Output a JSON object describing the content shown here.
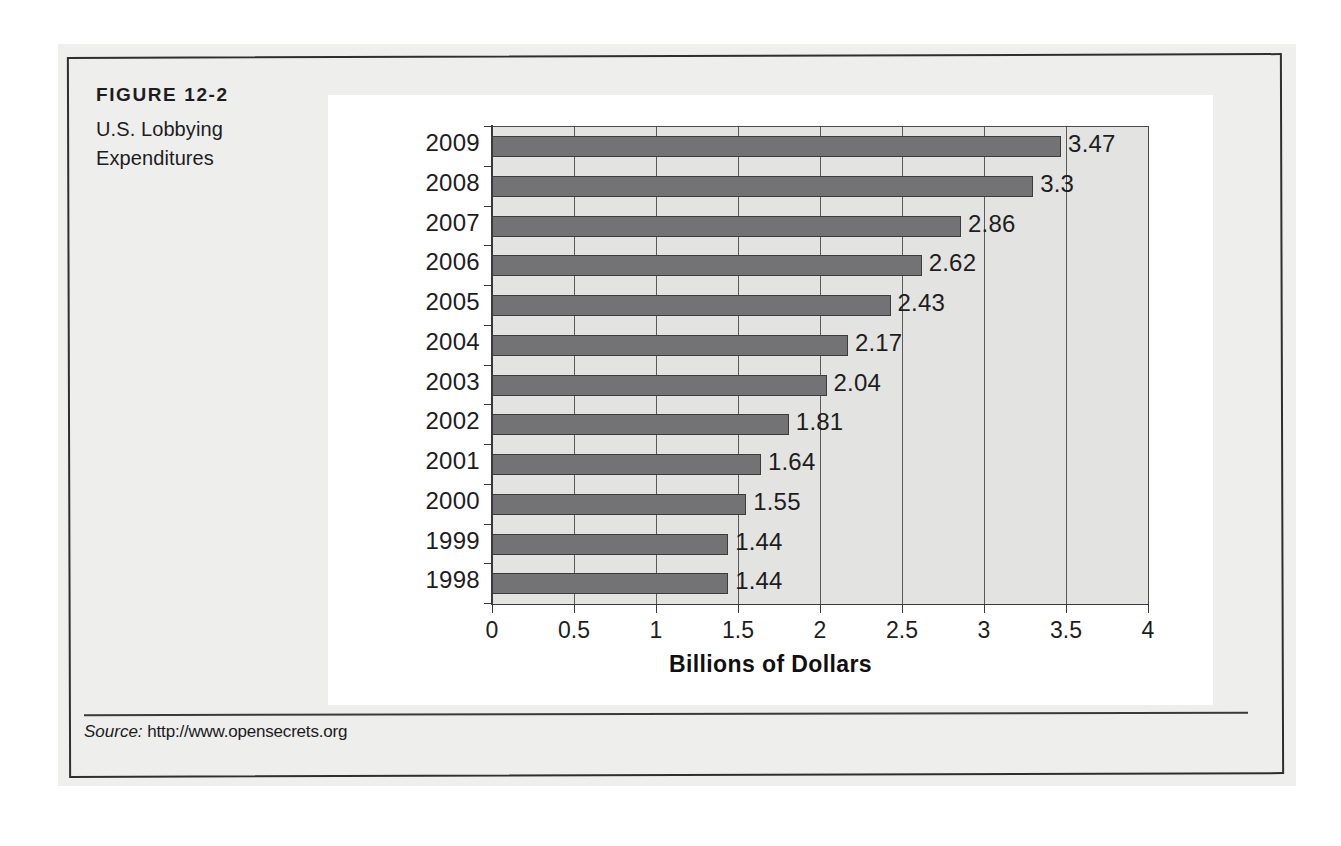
{
  "figure": {
    "number": "FIGURE 12-2",
    "title_line1": "U.S. Lobbying",
    "title_line2": "Expenditures"
  },
  "source": {
    "label": "Source:",
    "url": "http://www.opensecrets.org"
  },
  "colors": {
    "bar_fill": "#737375",
    "bar_stroke": "#3c3c3e",
    "plot_background": "#e3e3e1",
    "panel_background": "#ffffff",
    "paper_background": "#efefee",
    "frame_border": "#2f2f31",
    "text": "#1d1d1f"
  },
  "chart_data": {
    "type": "bar",
    "orientation": "horizontal",
    "title": "U.S. Lobbying Expenditures",
    "xlabel": "Billions of Dollars",
    "ylabel": "",
    "xlim": [
      0,
      4
    ],
    "xticks": [
      "0",
      "0.5",
      "1",
      "1.5",
      "2",
      "2.5",
      "3",
      "3.5",
      "4"
    ],
    "xtick_values": [
      0,
      0.5,
      1,
      1.5,
      2,
      2.5,
      3,
      3.5,
      4
    ],
    "grid": "vertical",
    "legend": "none",
    "categories": [
      "2009",
      "2008",
      "2007",
      "2006",
      "2005",
      "2004",
      "2003",
      "2002",
      "2001",
      "2000",
      "1999",
      "1998"
    ],
    "values": [
      3.47,
      3.3,
      2.86,
      2.62,
      2.43,
      2.17,
      2.04,
      1.81,
      1.64,
      1.55,
      1.44,
      1.44
    ],
    "data_labels": [
      "3.47",
      "3.3",
      "2.86",
      "2.62",
      "2.43",
      "2.17",
      "2.04",
      "1.81",
      "1.64",
      "1.55",
      "1.44",
      "1.44"
    ]
  }
}
